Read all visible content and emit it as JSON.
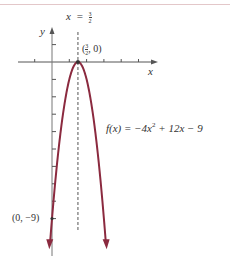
{
  "chart_data": {
    "type": "line",
    "title": "",
    "function_label": "f(x) = −4x² + 12x − 9",
    "function": {
      "a": -4,
      "b": 12,
      "c": -9
    },
    "xlabel": "x",
    "ylabel": "y",
    "xlim": [
      -1,
      5.5
    ],
    "ylim": [
      -11,
      2
    ],
    "x_ticks": [
      -1,
      1,
      2,
      3,
      4,
      5
    ],
    "y_ticks": [
      1,
      -1,
      -2,
      -3,
      -4,
      -5,
      -6,
      -7,
      -8,
      -9
    ],
    "grid": false,
    "curve_color": "#8b2a3f",
    "axis_of_symmetry": {
      "label_lhs": "x",
      "label_eq": "=",
      "num": "3",
      "den": "2",
      "x": 1.5,
      "style": "dashed"
    },
    "annotations": [
      {
        "text": "(3/2, 0)",
        "x": 1.5,
        "y": 0,
        "label_open": "(",
        "num": "3",
        "den": "2",
        "label_rest": ", 0)"
      },
      {
        "text": "(0, −9)",
        "x": 0,
        "y": -9
      }
    ],
    "points": [
      {
        "x": -0.12,
        "y": -10.5
      },
      {
        "x": 0,
        "y": -9
      },
      {
        "x": 0.5,
        "y": -4
      },
      {
        "x": 1,
        "y": -1
      },
      {
        "x": 1.5,
        "y": 0
      },
      {
        "x": 2,
        "y": -1
      },
      {
        "x": 2.5,
        "y": -4
      },
      {
        "x": 3,
        "y": -9
      },
      {
        "x": 3.12,
        "y": -10.5
      }
    ]
  },
  "labels": {
    "y_axis": "y",
    "x_axis": "x",
    "sym_x": "x",
    "sym_eq": "=",
    "sym_num": "3",
    "sym_den": "2",
    "vertex_open": "(",
    "vertex_num": "3",
    "vertex_den": "2",
    "vertex_rest": ", 0)",
    "y_intercept": "(0, −9)",
    "function_text": "f(x) = −4x² + 12x − 9"
  }
}
